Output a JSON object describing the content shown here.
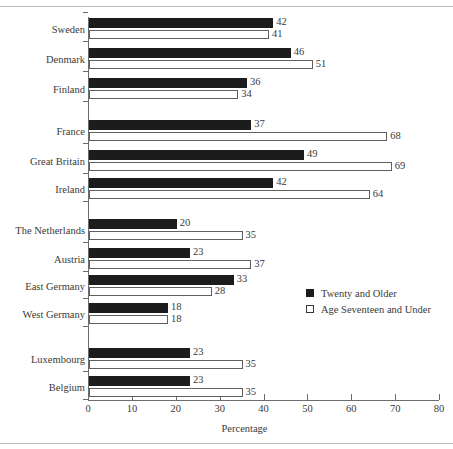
{
  "chart_data": {
    "type": "bar",
    "orientation": "horizontal",
    "title": "",
    "xlabel": "Percentage",
    "ylabel": "",
    "xlim": [
      0,
      80
    ],
    "xticks": [
      0,
      10,
      20,
      30,
      40,
      50,
      60,
      70,
      80
    ],
    "grid": false,
    "legend_position": "middle-right",
    "legend": [
      "Twenty and Older",
      "Age Seventeen and Under"
    ],
    "colors": {
      "twenty_and_older": "#1c1c1c",
      "age_seventeen_and_under": "#ffffff",
      "outline": "#5f5f5f",
      "axis": "#6d6d6d",
      "rule": "#b9b9b9",
      "text": "#3a3a3a"
    },
    "categories": [
      "Sweden",
      "Denmark",
      "Finland",
      "France",
      "Great Britain",
      "Ireland",
      "The Netherlands",
      "Austria",
      "East Germany",
      "West Germany",
      "Luxembourg",
      "Belgium"
    ],
    "groups": [
      {
        "name": "",
        "categories": [
          "Sweden",
          "Denmark",
          "Finland"
        ]
      },
      {
        "name": "",
        "categories": [
          "France",
          "Great Britain",
          "Ireland"
        ]
      },
      {
        "name": "",
        "categories": [
          "The Netherlands",
          "Austria",
          "East Germany",
          "West Germany"
        ]
      },
      {
        "name": "",
        "categories": [
          "Luxembourg",
          "Belgium"
        ]
      }
    ],
    "series": [
      {
        "name": "Twenty and Older",
        "values": [
          42,
          46,
          36,
          37,
          49,
          42,
          20,
          23,
          33,
          18,
          23,
          23
        ]
      },
      {
        "name": "Age Seventeen and Under",
        "values": [
          41,
          51,
          34,
          68,
          69,
          64,
          35,
          37,
          28,
          18,
          35,
          35
        ]
      }
    ],
    "rows": [
      {
        "label": "Sweden",
        "older": 42,
        "younger": 41,
        "top": 17
      },
      {
        "label": "Denmark",
        "older": 46,
        "younger": 51,
        "top": 47
      },
      {
        "label": "Finland",
        "older": 36,
        "younger": 34,
        "top": 77
      },
      {
        "label": "France",
        "older": 37,
        "younger": 68,
        "top": 119
      },
      {
        "label": "Great Britain",
        "older": 49,
        "younger": 69,
        "top": 149
      },
      {
        "label": "Ireland",
        "older": 42,
        "younger": 64,
        "top": 177
      },
      {
        "label": "The Netherlands",
        "older": 20,
        "younger": 35,
        "top": 218
      },
      {
        "label": "Austria",
        "older": 23,
        "younger": 37,
        "top": 247
      },
      {
        "label": "East Germany",
        "older": 33,
        "younger": 28,
        "top": 274
      },
      {
        "label": "West Germany",
        "older": 18,
        "younger": 18,
        "top": 302
      },
      {
        "label": "Luxembourg",
        "older": 23,
        "younger": 35,
        "top": 347
      },
      {
        "label": "Belgium",
        "older": 23,
        "younger": 35,
        "top": 375
      }
    ]
  }
}
